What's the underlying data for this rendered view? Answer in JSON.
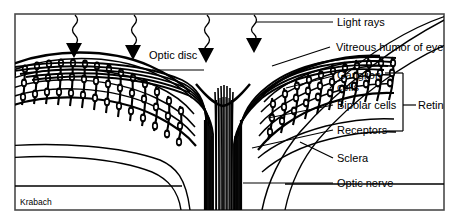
{
  "figure": {
    "signature": "Krabach",
    "border_color": "#4a4a4a",
    "ink_color": "#000000",
    "background_color": "#ffffff"
  },
  "labels": {
    "optic_disc": "Optic disc",
    "light_rays": "Light rays",
    "vitreous_humor": "Vitreous humor  of eye",
    "ganglion_cells_line1": "Ganglion",
    "ganglion_cells_line2": "cells",
    "bipolar_cells": "Bipolar  cells",
    "receptors": "Receptors",
    "retina": "Retina",
    "sclera": "Sclera",
    "optic_nerve": "Optic nerve"
  },
  "icons": {
    "light_ray_arrow": "down-arrowhead-icon",
    "wavy_ray": "wavy-line-icon",
    "retina_bracket": "bracket-icon"
  },
  "structures": [
    "light rays",
    "vitreous humor of eye",
    "ganglion cells",
    "bipolar cells",
    "receptors",
    "retina",
    "sclera",
    "optic nerve",
    "optic disc"
  ],
  "light_ray_arrow_count": 4
}
